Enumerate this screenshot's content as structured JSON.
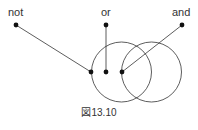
{
  "labels": {
    "not": "not",
    "or": "or",
    "and": "and"
  },
  "caption": "図13.10",
  "colors": {
    "stroke": "#333333",
    "dot": "#111111"
  }
}
